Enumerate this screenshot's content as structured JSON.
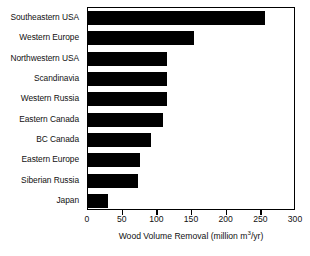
{
  "chart_data": {
    "type": "bar",
    "orientation": "horizontal",
    "title": "",
    "xlabel": "Wood Volume Removal (million m3/yr)",
    "xlabel_parts": {
      "prefix": "Wood Volume Removal (million m",
      "superscript": "3",
      "suffix": "/yr)"
    },
    "ylabel": "",
    "categories": [
      "Southeastern USA",
      "Western Europe",
      "Northwestern USA",
      "Scandinavia",
      "Western Russia",
      "Eastern Canada",
      "BC Canada",
      "Eastern Europe",
      "Siberian Russia",
      "Japan"
    ],
    "values": [
      255,
      153,
      114,
      114,
      114,
      108,
      91,
      75,
      72,
      29
    ],
    "xlim": [
      0,
      300
    ],
    "xticks": [
      0,
      50,
      100,
      150,
      200,
      250,
      300
    ],
    "xticklabels": [
      "0",
      "50",
      "100",
      "150",
      "200",
      "250",
      "300"
    ],
    "grid": false,
    "legend": null,
    "bar_color": "#000000",
    "frame_color": "#000000",
    "background_color": "#ffffff"
  }
}
